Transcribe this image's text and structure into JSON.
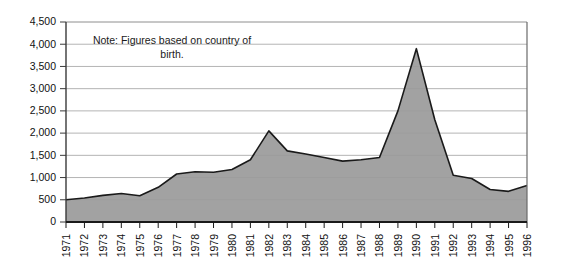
{
  "chart_data": {
    "type": "area",
    "title": "",
    "xlabel": "",
    "ylabel": "",
    "grid": true,
    "legend": null,
    "annotations": [
      {
        "name": "note",
        "line1": "Note: Figures based on country of",
        "line2": "birth."
      }
    ],
    "ylim": [
      0,
      4500
    ],
    "ytick_labels": [
      "4,500",
      "4,000",
      "3,500",
      "3,000",
      "2,500",
      "2,000",
      "1,500",
      "1,000",
      "500",
      "0"
    ],
    "ytick_values": [
      4500,
      4000,
      3500,
      3000,
      2500,
      2000,
      1500,
      1000,
      500,
      0
    ],
    "categories": [
      "1971",
      "1972",
      "1973",
      "1974",
      "1975",
      "1976",
      "1977",
      "1978",
      "1979",
      "1980",
      "1981",
      "1982",
      "1983",
      "1984",
      "1985",
      "1986",
      "1987",
      "1988",
      "1989",
      "1990",
      "1991",
      "1992",
      "1993",
      "1994",
      "1995",
      "1996"
    ],
    "values": [
      500,
      540,
      600,
      640,
      590,
      780,
      1080,
      1130,
      1120,
      1180,
      1400,
      2050,
      1600,
      1530,
      1450,
      1370,
      1400,
      1450,
      2500,
      3900,
      2300,
      1050,
      980,
      730,
      690,
      820
    ],
    "series": [
      {
        "name": "Figures",
        "values": [
          500,
          540,
          600,
          640,
          590,
          780,
          1080,
          1130,
          1120,
          1180,
          1400,
          2050,
          1600,
          1530,
          1450,
          1370,
          1400,
          1450,
          2500,
          3900,
          2300,
          1050,
          980,
          730,
          690,
          820
        ]
      }
    ],
    "colors": {
      "area_fill": "#9a9a9a",
      "area_line": "#1a1a1a",
      "grid": "#b4b4b4",
      "axis": "#3a3a3a",
      "text": "#111111",
      "background": "#ffffff"
    }
  }
}
